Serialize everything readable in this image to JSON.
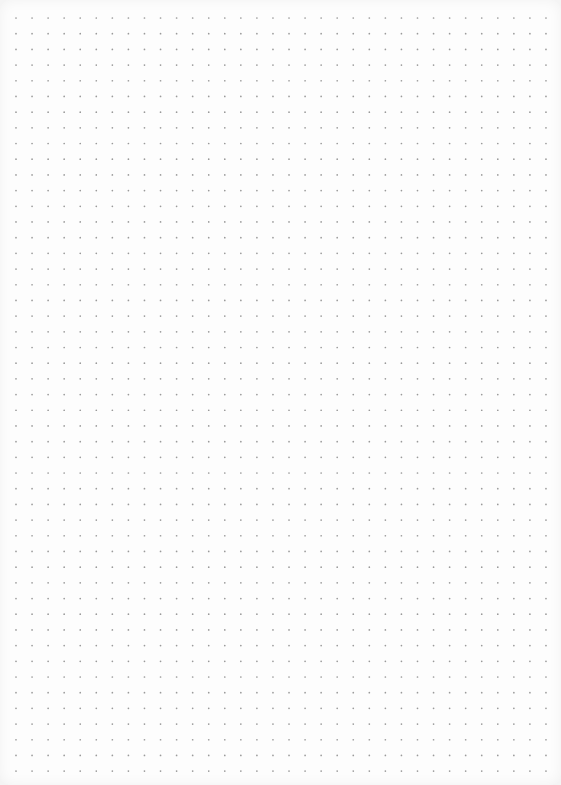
{
  "page": {
    "type": "dot-grid-paper",
    "background_color": "#fdfdfd",
    "dot_color": "#9a9a9a",
    "dot_radius": 0.85,
    "grid": {
      "columns": 34,
      "rows": 49,
      "origin_x": 16,
      "origin_y": 18,
      "spacing_x": 16.06,
      "spacing_y": 15.69
    }
  }
}
